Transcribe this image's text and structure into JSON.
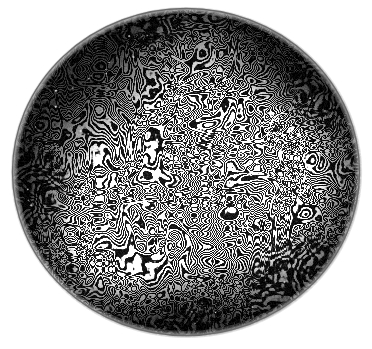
{
  "image": {
    "title": "Labyrinthine Turing pattern in a circular dish",
    "subject": "reaction-diffusion stripe pattern",
    "medium": "grayscale photograph",
    "width": 372,
    "height": 349,
    "background_color": "#ffffff"
  },
  "dish": {
    "label": "circular petri dish",
    "center_x": 186,
    "center_y": 172,
    "radius_x": 174,
    "radius_y": 164,
    "rim_label": "dish rim outline",
    "rim_color": "#6d6d6d",
    "rim_width_px": 1.4,
    "interior_base_color": "#080808"
  },
  "pattern": {
    "type": "labyrinthine",
    "description": "worm-like meandering stripes, no global orientation",
    "stripe_color": "#dcdcdc",
    "stripe_highlight_color": "#ffffff",
    "gap_color": "#050505",
    "stripe_width_px": 6.5,
    "period_px": 16,
    "seed": 20240517,
    "noise_strength": 0.22,
    "field_scale": 0.062,
    "octaves": 4,
    "band_sharpness": 7.5
  },
  "illumination": {
    "label": "uneven lighting across dish",
    "vignette_strength": 0.92,
    "vignette_inner": 0.34,
    "vignette_outer": 1.02,
    "hotspots": [
      {
        "name": "lower-left-glow",
        "x": 118,
        "y": 232,
        "radius": 86,
        "gain": 0.62
      },
      {
        "name": "right-center-glow",
        "x": 268,
        "y": 168,
        "radius": 78,
        "gain": 0.58
      },
      {
        "name": "center-glow",
        "x": 190,
        "y": 196,
        "radius": 96,
        "gain": 0.3
      },
      {
        "name": "upper-mid-glow",
        "x": 205,
        "y": 108,
        "radius": 60,
        "gain": 0.16
      }
    ],
    "dark_zones": [
      {
        "name": "top-left-shadow",
        "x": 72,
        "y": 62,
        "radius": 104,
        "gain": 0.58
      },
      {
        "name": "top-right-shadow",
        "x": 300,
        "y": 56,
        "radius": 84,
        "gain": 0.46
      },
      {
        "name": "bottom-shadow",
        "x": 176,
        "y": 318,
        "radius": 86,
        "gain": 0.42
      },
      {
        "name": "left-shadow",
        "x": 34,
        "y": 196,
        "radius": 64,
        "gain": 0.32
      }
    ]
  },
  "spot_zones": [
    {
      "name": "left-rim-stipple",
      "x": 30,
      "y": 182,
      "radius": 48,
      "strength": 0.95
    },
    {
      "name": "lower-right-rim-stipple",
      "x": 296,
      "y": 286,
      "radius": 62,
      "strength": 0.95
    },
    {
      "name": "upper-right-rim-stipple",
      "x": 316,
      "y": 92,
      "radius": 44,
      "strength": 0.7
    },
    {
      "name": "bottom-rim-stipple",
      "x": 196,
      "y": 330,
      "radius": 46,
      "strength": 0.6
    },
    {
      "name": "top-rim-stipple",
      "x": 150,
      "y": 22,
      "radius": 40,
      "strength": 0.55
    }
  ],
  "grain": {
    "label": "film grain",
    "amount": 26,
    "speckle_count": 210,
    "speckle_color": "#ffffff"
  }
}
